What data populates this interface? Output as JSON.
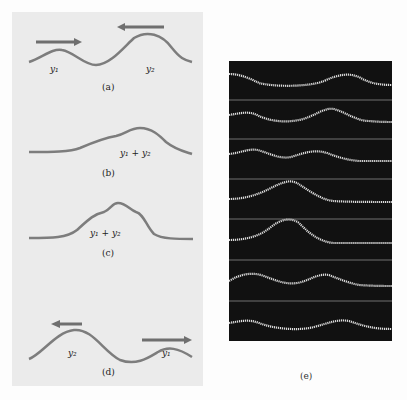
{
  "figure": {
    "panels": [
      {
        "id": "a",
        "caption": "(a)",
        "labels": [
          "y1",
          "y2"
        ],
        "arrows": [
          "right",
          "left"
        ]
      },
      {
        "id": "b",
        "caption": "(b)",
        "labels": [
          "y1 + y2"
        ]
      },
      {
        "id": "c",
        "caption": "(c)",
        "labels": [
          "y1 + y2"
        ]
      },
      {
        "id": "d",
        "caption": "(d)",
        "labels": [
          "y2",
          "y1"
        ],
        "arrows": [
          "left",
          "right"
        ]
      },
      {
        "id": "e",
        "caption": "(e)",
        "frames": 7
      }
    ],
    "colors": {
      "curve": "#7d7d7d",
      "arrow": "#6f6f6f",
      "panel_bg": "#ebebeb",
      "photo_bg": "#111111",
      "trace": "#dcdcdc"
    }
  },
  "text": {
    "a_y1": "y₁",
    "a_y2": "y₂",
    "a_cap": "(a)",
    "b_sum": "y₁ + y₂",
    "b_cap": "(b)",
    "c_sum": "y₁ + y₂",
    "c_cap": "(c)",
    "d_y2": "y₂",
    "d_y1": "y₁",
    "d_cap": "(d)",
    "e_cap": "(e)"
  }
}
